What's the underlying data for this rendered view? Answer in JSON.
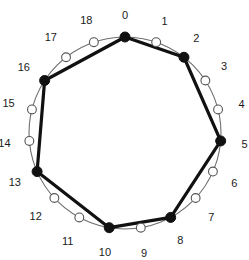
{
  "figure": {
    "type": "cycle-graph-diagram",
    "total_points": 19,
    "colors": {
      "background": "#ffffff",
      "circle_stroke": "#6e6e6e",
      "polygon_stroke": "#111111",
      "filled_node_fill": "#111111",
      "filled_node_stroke": "#111111",
      "hollow_node_fill": "#ffffff",
      "hollow_node_stroke": "#555555",
      "label_color": "#1a1a1a"
    },
    "geometry": {
      "center_x": 125,
      "center_y": 133,
      "radius": 96,
      "start_angle_deg": -90,
      "label_radius": 116,
      "circle_stroke_width": 1.1,
      "polygon_stroke_width": 3.2,
      "node_radius_filled": 5,
      "node_radius_hollow": 4.4
    },
    "nodes": [
      {
        "id": 0,
        "label": "0",
        "filled": true,
        "label_dx": 0,
        "label_dy": -2
      },
      {
        "id": 1,
        "label": "1",
        "filled": false,
        "label_dx": 2,
        "label_dy": -2
      },
      {
        "id": 2,
        "label": "2",
        "filled": true,
        "label_dx": 0,
        "label_dy": -3
      },
      {
        "id": 3,
        "label": "3",
        "filled": false,
        "label_dx": 2,
        "label_dy": -4
      },
      {
        "id": 4,
        "label": "4",
        "filled": false,
        "label_dx": 4,
        "label_dy": -1
      },
      {
        "id": 5,
        "label": "5",
        "filled": true,
        "label_dx": 4,
        "label_dy": 1
      },
      {
        "id": 6,
        "label": "6",
        "filled": false,
        "label_dx": 3,
        "label_dy": 3
      },
      {
        "id": 7,
        "label": "7",
        "filled": false,
        "label_dx": 1,
        "label_dy": 5
      },
      {
        "id": 8,
        "label": "8",
        "filled": true,
        "label_dx": 0,
        "label_dy": 5
      },
      {
        "id": 9,
        "label": "9",
        "filled": false,
        "label_dx": 0,
        "label_dy": 6
      },
      {
        "id": 10,
        "label": "10",
        "filled": true,
        "label_dx": -1,
        "label_dy": 5
      },
      {
        "id": 11,
        "label": "11",
        "filled": false,
        "label_dx": -2,
        "label_dy": 6
      },
      {
        "id": 12,
        "label": "12",
        "filled": false,
        "label_dx": -4,
        "label_dy": 4
      },
      {
        "id": 13,
        "label": "13",
        "filled": true,
        "label_dx": -4,
        "label_dy": 2
      },
      {
        "id": 14,
        "label": "14",
        "filled": false,
        "label_dx": -5,
        "label_dy": 0
      },
      {
        "id": 15,
        "label": "15",
        "filled": false,
        "label_dx": -4,
        "label_dy": -2
      },
      {
        "id": 16,
        "label": "16",
        "filled": true,
        "label_dx": -4,
        "label_dy": -3
      },
      {
        "id": 17,
        "label": "17",
        "filled": false,
        "label_dx": -3,
        "label_dy": -4
      },
      {
        "id": 18,
        "label": "18",
        "filled": false,
        "label_dx": -1,
        "label_dy": -3
      }
    ],
    "polygon_vertices": [
      0,
      2,
      5,
      8,
      10,
      13,
      16
    ],
    "polygon_edges": [
      {
        "from": 0,
        "to": 2
      },
      {
        "from": 2,
        "to": 5
      },
      {
        "from": 5,
        "to": 8
      },
      {
        "from": 8,
        "to": 10
      },
      {
        "from": 10,
        "to": 13
      },
      {
        "from": 13,
        "to": 16
      },
      {
        "from": 16,
        "to": 0
      }
    ]
  }
}
